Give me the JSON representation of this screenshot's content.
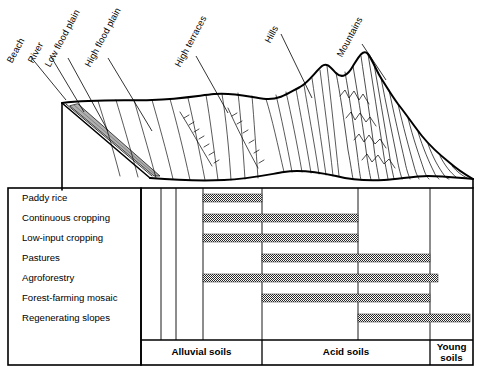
{
  "diagram": {
    "terrain_labels": [
      {
        "text": "Beach",
        "x": 10,
        "y": 58,
        "angle": -62,
        "lx": 30,
        "ly": 56,
        "tx": 66,
        "ty": 100
      },
      {
        "text": "River",
        "x": 31,
        "y": 58,
        "angle": -62,
        "lx": 50,
        "ly": 55,
        "tx": 84,
        "ty": 112
      },
      {
        "text": "Low flood plain",
        "x": 48,
        "y": 62,
        "angle": -62,
        "lx": 68,
        "ly": 58,
        "tx": 108,
        "ty": 131
      },
      {
        "text": "High flood plain",
        "x": 88,
        "y": 62,
        "angle": -62,
        "lx": 108,
        "ly": 58,
        "tx": 152,
        "ty": 131
      },
      {
        "text": "High terraces",
        "x": 178,
        "y": 62,
        "angle": -62,
        "lx": 196,
        "ly": 56,
        "tx": 228,
        "ty": 113
      },
      {
        "text": "Hills",
        "x": 268,
        "y": 38,
        "angle": -62,
        "lx": 281,
        "ly": 34,
        "tx": 312,
        "ty": 98
      },
      {
        "text": "Mountains",
        "x": 340,
        "y": 52,
        "angle": -62,
        "lx": 362,
        "ly": 44,
        "tx": 386,
        "ty": 80
      }
    ],
    "rows": [
      {
        "label": "Paddy rice",
        "bars": [
          {
            "x1": 203,
            "x2": 262
          }
        ]
      },
      {
        "label": "Continuous cropping",
        "bars": [
          {
            "x1": 203,
            "x2": 358
          }
        ]
      },
      {
        "label": "Low-input cropping",
        "bars": [
          {
            "x1": 203,
            "x2": 358
          }
        ]
      },
      {
        "label": "Pastures",
        "bars": [
          {
            "x1": 262,
            "x2": 430
          }
        ]
      },
      {
        "label": "Agroforestry",
        "bars": [
          {
            "x1": 203,
            "x2": 438
          }
        ]
      },
      {
        "label": "Forest-farming mosaic",
        "bars": [
          {
            "x1": 262,
            "x2": 430
          }
        ]
      },
      {
        "label": "Regenerating slopes",
        "bars": [
          {
            "x1": 358,
            "x2": 470
          }
        ]
      }
    ],
    "soil_bands": [
      {
        "label": "Alluvial soils",
        "x1": 141,
        "x2": 262
      },
      {
        "label": "Acid soils",
        "x1": 262,
        "x2": 430
      },
      {
        "label": "Young\nsoils",
        "x1": 430,
        "x2": 473
      }
    ],
    "column_dividers": [
      141,
      161,
      176,
      203,
      262,
      358,
      430,
      473
    ],
    "colors": {
      "line": "#000000",
      "bar_fill": "#2b2b2b",
      "river_fill": "#b0b0b0",
      "background": "#ffffff"
    },
    "geometry": {
      "chart_top": 188,
      "chart_bottom": 340,
      "soil_band_bottom": 365,
      "row_height": 20,
      "bar_height": 8,
      "label_box": {
        "x": 8,
        "y": 188,
        "w": 133,
        "h": 177
      }
    }
  }
}
